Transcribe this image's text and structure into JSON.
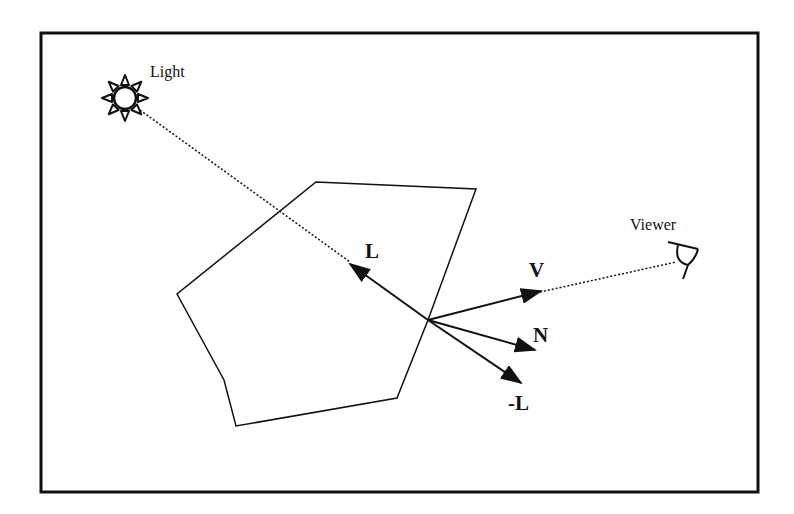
{
  "diagram": {
    "labels": {
      "light": "Light",
      "viewer": "Viewer",
      "L": "L",
      "V": "V",
      "N": "N",
      "negL": "-L"
    },
    "colors": {
      "stroke": "#111111",
      "background": "#ffffff"
    },
    "icons": [
      "sun-icon",
      "eye-icon"
    ]
  }
}
